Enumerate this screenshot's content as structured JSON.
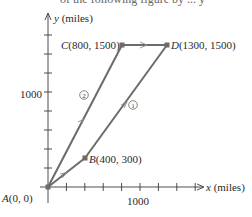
{
  "clipped_header": "of the following figure by ... y",
  "axes": {
    "x_label_var": "x",
    "x_label_unit": " (miles)",
    "y_label_var": "y",
    "y_label_unit": " (miles)",
    "x_tick_label": "1000",
    "y_tick_label": "1000"
  },
  "points": {
    "A": {
      "name": "A",
      "coords": "(0, 0)",
      "x": 0,
      "y": 0
    },
    "B": {
      "name": "B",
      "coords": "(400, 300)",
      "x": 400,
      "y": 300
    },
    "C": {
      "name": "C",
      "coords": "(800, 1500)",
      "x": 800,
      "y": 1500
    },
    "D": {
      "name": "D",
      "coords": "(1300, 1500)",
      "x": 1300,
      "y": 1500
    }
  },
  "routes": {
    "route1_marker": "1",
    "route2_marker": "2"
  },
  "colors": {
    "path": "#6b6b6b",
    "axis": "#3a3a3a",
    "text": "#2a2a2a"
  }
}
